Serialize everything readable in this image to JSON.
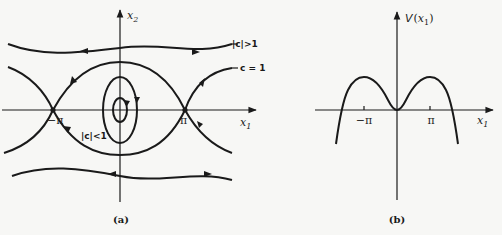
{
  "figure": {
    "panel_a": {
      "caption": "(a)",
      "x_axis_label": "x",
      "x_axis_sub": "1",
      "y_axis_label": "x",
      "y_axis_sub": "2",
      "tick_neg_pi": "−π",
      "tick_pi": "π",
      "curve_labels": {
        "outer": "|c|>1",
        "separatrix": "c = 1",
        "inner": "|c|<1"
      },
      "equilibria": [
        {
          "name": "saddle-left",
          "x1": "-π",
          "x2": 0
        },
        {
          "name": "center",
          "x1": 0,
          "x2": 0
        },
        {
          "name": "saddle-right",
          "x1": "π",
          "x2": 0
        }
      ]
    },
    "panel_b": {
      "caption": "(b)",
      "y_axis_label": "V(x",
      "y_axis_sub": "1",
      "y_axis_close": ")",
      "x_axis_label": "x",
      "x_axis_sub": "1",
      "tick_neg_pi": "−π",
      "tick_pi": "π"
    }
  }
}
